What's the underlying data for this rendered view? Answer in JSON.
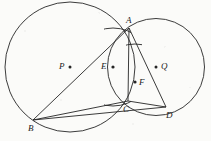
{
  "figure": {
    "stroke_color": "#262626",
    "background_color": "#fbfbf9",
    "width": 211,
    "height": 141,
    "points": [
      {
        "id": "A",
        "label": "A",
        "x": 129,
        "y": 28,
        "label_x": 126,
        "label_y": 17,
        "dot": false
      },
      {
        "id": "B",
        "label": "B",
        "x": 33,
        "y": 120,
        "label_x": 29,
        "label_y": 124,
        "dot": false
      },
      {
        "id": "C",
        "label": "C",
        "x": 128,
        "y": 101,
        "label_x": 124,
        "label_y": 107,
        "dot": false
      },
      {
        "id": "D",
        "label": "D",
        "x": 166,
        "y": 107,
        "label_x": 166,
        "label_y": 112,
        "dot": false
      },
      {
        "id": "P",
        "label": "P",
        "x": 70,
        "y": 67,
        "label_x": 60,
        "label_y": 62,
        "dot": true
      },
      {
        "id": "Q",
        "label": "Q",
        "x": 156,
        "y": 67,
        "label_x": 161,
        "label_y": 62,
        "dot": true
      },
      {
        "id": "E",
        "label": "E",
        "x": 113,
        "y": 67,
        "label_x": 102,
        "label_y": 62,
        "dot": true
      },
      {
        "id": "F",
        "label": "F",
        "x": 135,
        "y": 82,
        "label_x": 139,
        "label_y": 78,
        "dot": true
      }
    ],
    "circles": [
      {
        "id": "circle-P",
        "cx": 70,
        "cy": 67,
        "r": 65,
        "stroke_width": 0.9
      },
      {
        "id": "circle-Q",
        "cx": 156,
        "cy": 67,
        "r": 48.5,
        "stroke_width": 0.9
      },
      {
        "id": "circle-E",
        "cx": 113,
        "cy": 67,
        "r": 39,
        "stroke_width": 0.9
      },
      {
        "id": "circle-F",
        "cx": 135,
        "cy": 82,
        "r": 38,
        "stroke_width": 0.9
      }
    ],
    "segments": [
      {
        "id": "segment-AB",
        "from": "A",
        "to": "B"
      },
      {
        "id": "segment-AC",
        "from": "A",
        "to": "C"
      },
      {
        "id": "segment-AD",
        "from": "A",
        "to": "D"
      },
      {
        "id": "segment-BC",
        "from": "B",
        "to": "C"
      },
      {
        "id": "segment-BD",
        "from": "B",
        "to": "D"
      },
      {
        "id": "segment-CD",
        "from": "C",
        "to": "D"
      }
    ]
  }
}
